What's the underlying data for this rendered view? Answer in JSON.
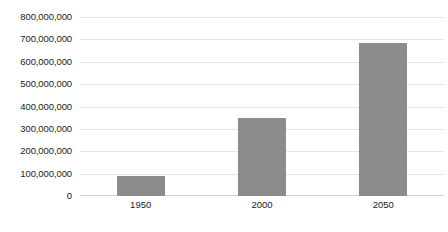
{
  "chart_data": {
    "type": "bar",
    "title": "",
    "xlabel": "",
    "ylabel": "",
    "categories": [
      "1950",
      "2000",
      "2050"
    ],
    "values": [
      90000000,
      350000000,
      685000000
    ],
    "series": [
      {
        "name": "",
        "values": [
          90000000,
          350000000,
          685000000
        ]
      }
    ],
    "ylim": [
      0,
      800000000
    ],
    "ytick_values": [
      0,
      100000000,
      200000000,
      300000000,
      400000000,
      500000000,
      600000000,
      700000000,
      800000000
    ],
    "ytick_labels": [
      "800,000,000",
      "700,000,000",
      "600,000,000",
      "500,000,000",
      "400,000,000",
      "300,000,000",
      "200,000,000",
      "100,000,000",
      "0"
    ],
    "grid": true,
    "grid_orientation": "horizontal",
    "legend": false,
    "legend_position": "none",
    "bar_color": "#8c8c8c",
    "gridline_color": "#e4e4e4",
    "baseline_color": "#d2d2d2",
    "background_color": "#ffffff"
  }
}
